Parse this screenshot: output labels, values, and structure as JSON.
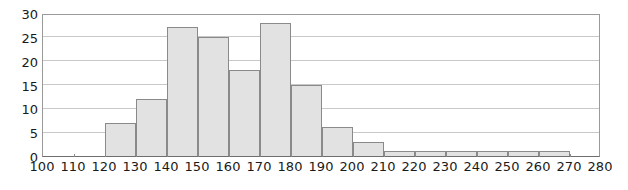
{
  "chart_data": {
    "type": "bar",
    "title": "",
    "subtitle": "",
    "xlabel": "",
    "ylabel": "",
    "xlim": [
      100,
      280
    ],
    "ylim": [
      0,
      30
    ],
    "grid": true,
    "legend": false,
    "bin_width": 10,
    "x_ticks": [
      100,
      110,
      120,
      130,
      140,
      150,
      160,
      170,
      180,
      190,
      200,
      210,
      220,
      230,
      240,
      250,
      260,
      270,
      280
    ],
    "y_ticks": [
      0,
      5,
      10,
      15,
      20,
      25,
      30
    ],
    "categories": [
      "100-110",
      "110-120",
      "120-130",
      "130-140",
      "140-150",
      "150-160",
      "160-170",
      "170-180",
      "180-190",
      "190-200",
      "200-210",
      "210-220",
      "220-230",
      "230-240",
      "240-250",
      "250-260",
      "260-270",
      "270-280"
    ],
    "bin_starts": [
      100,
      110,
      120,
      130,
      140,
      150,
      160,
      170,
      180,
      190,
      200,
      210,
      220,
      230,
      240,
      250,
      260,
      270
    ],
    "values": [
      0,
      0,
      7,
      12,
      27,
      25,
      18,
      28,
      15,
      6,
      3,
      1,
      1,
      1,
      1,
      1,
      1,
      0
    ],
    "colors": {
      "bar_fill": "#e2e2e2",
      "bar_stroke": "#8a8a8a",
      "gridline": "#c9c9c9",
      "axis": "#6e6e6e",
      "text": "#1a1a1a",
      "background": "#ffffff"
    }
  }
}
